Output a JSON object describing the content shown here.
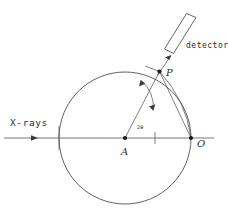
{
  "figure": {
    "background_color": "#ffffff",
    "line_color": "#3a3a3a",
    "beam_color": "#6a6a6a",
    "width": 228,
    "height": 215
  },
  "labels": {
    "xrays": "X-rays",
    "detector": "detector",
    "point_p": "P",
    "point_a": "A",
    "point_o": "O",
    "angle": "2θ"
  },
  "geometry": {
    "circle": {
      "cx": 125,
      "cy": 138,
      "r": 66
    },
    "center_point": {
      "x": 125,
      "y": 138,
      "name": "A"
    },
    "origin_point": {
      "x": 191,
      "y": 138,
      "name": "O"
    },
    "sample_point": {
      "x": 159.5,
      "y": 71.5,
      "name": "P"
    },
    "beam_line": {
      "x1": 4,
      "y1": 138,
      "x2": 214,
      "y2": 138
    },
    "angle_arc": {
      "label": "2θ",
      "from_deg": 0,
      "to_deg": 63
    },
    "detector": {
      "corner_tl": {
        "x": 186.5,
        "y": 13.5
      },
      "corner_tr": {
        "x": 196.0,
        "y": 17.5
      },
      "corner_br": {
        "x": 173.5,
        "y": 53.5
      },
      "corner_bl": {
        "x": 164.5,
        "y": 49.0
      }
    }
  }
}
